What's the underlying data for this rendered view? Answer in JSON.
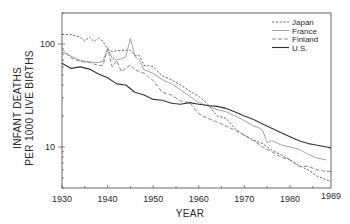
{
  "chart_data": {
    "type": "line",
    "title": "",
    "xlabel": "YEAR",
    "ylabel": [
      "INFANT DEATHS",
      "PER 1000 LIVE BIRTHS"
    ],
    "yscale": "log",
    "xlim": [
      1930,
      1989
    ],
    "ylim": [
      4,
      200
    ],
    "x_ticks": [
      1930,
      1940,
      1950,
      1960,
      1970,
      1980,
      1989
    ],
    "x_tick_labels": [
      "1930",
      "1940",
      "1950",
      "1960",
      "1970",
      "1980",
      "1989"
    ],
    "y_ticks": [
      10,
      100
    ],
    "y_tick_labels": [
      "10",
      "100"
    ],
    "grid": false,
    "legend_position": "upper right",
    "series": [
      {
        "name": "Japan",
        "style": "short-dash",
        "color": "#555555",
        "x": [
          1930,
          1932,
          1934,
          1935,
          1936,
          1937,
          1938,
          1939,
          1940,
          1941,
          1942,
          1943,
          1944,
          1945,
          1946,
          1947,
          1948,
          1949,
          1950,
          1952,
          1954,
          1956,
          1958,
          1960,
          1962,
          1964,
          1966,
          1968,
          1970,
          1972,
          1974,
          1976,
          1978,
          1980,
          1982,
          1984,
          1986,
          1988,
          1989
        ],
        "values": [
          124,
          124,
          117,
          107,
          117,
          106,
          114,
          106,
          90,
          84,
          86,
          86,
          87,
          87,
          77,
          77,
          62,
          62,
          60,
          49,
          45,
          40,
          35,
          31,
          26,
          20,
          19,
          15,
          13,
          11.7,
          10.8,
          9.3,
          8.4,
          7.5,
          6.6,
          6.0,
          5.2,
          4.8,
          4.6
        ]
      },
      {
        "name": "France",
        "style": "solid-light",
        "color": "#9a9a9a",
        "x": [
          1930,
          1932,
          1934,
          1936,
          1938,
          1939,
          1940,
          1941,
          1942,
          1943,
          1944,
          1945,
          1946,
          1947,
          1948,
          1950,
          1952,
          1954,
          1956,
          1958,
          1960,
          1962,
          1964,
          1966,
          1968,
          1970,
          1972,
          1973,
          1974,
          1975,
          1976,
          1978,
          1980,
          1982,
          1984,
          1986,
          1988
        ],
        "values": [
          84,
          76,
          69,
          67,
          66,
          68,
          91,
          73,
          70,
          72,
          75,
          114,
          76,
          70,
          56,
          52,
          45,
          41,
          36,
          31,
          27,
          25,
          23,
          22,
          20,
          18,
          16,
          15.5,
          14.5,
          11,
          11.5,
          10.5,
          10,
          9.5,
          8.5,
          7.8,
          7.5
        ]
      },
      {
        "name": "Finland",
        "style": "long-dash",
        "color": "#7a7a7a",
        "x": [
          1930,
          1932,
          1934,
          1936,
          1938,
          1939,
          1940,
          1941,
          1942,
          1943,
          1944,
          1945,
          1946,
          1948,
          1950,
          1952,
          1954,
          1956,
          1958,
          1960,
          1962,
          1964,
          1966,
          1968,
          1970,
          1972,
          1974,
          1976,
          1978,
          1980,
          1982,
          1984,
          1986,
          1988,
          1989
        ],
        "values": [
          90,
          73,
          68,
          66,
          62,
          62,
          89,
          60,
          69,
          54,
          58,
          63,
          56,
          52,
          44,
          34,
          32,
          28,
          27,
          21,
          19,
          17.5,
          16,
          14.5,
          13,
          11.5,
          10,
          9,
          8,
          7.5,
          6.5,
          6.5,
          6.0,
          5.8,
          5.8
        ]
      },
      {
        "name": "U.S.",
        "style": "solid-dark",
        "color": "#333333",
        "x": [
          1930,
          1932,
          1934,
          1936,
          1938,
          1940,
          1942,
          1944,
          1946,
          1948,
          1950,
          1952,
          1954,
          1956,
          1958,
          1960,
          1962,
          1964,
          1966,
          1968,
          1970,
          1972,
          1974,
          1976,
          1978,
          1980,
          1982,
          1984,
          1986,
          1988,
          1989
        ],
        "values": [
          65,
          58,
          60,
          57,
          51,
          47,
          41,
          40,
          34,
          32,
          29,
          28.4,
          26.6,
          26,
          27,
          26,
          25.3,
          24.8,
          23.7,
          21.8,
          20,
          18.5,
          16.7,
          15.2,
          13.8,
          12.6,
          11.5,
          10.8,
          10.4,
          10.0,
          9.8
        ]
      }
    ]
  }
}
